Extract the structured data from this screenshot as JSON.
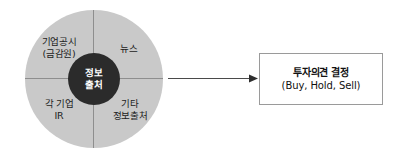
{
  "diagram": {
    "title_present": false,
    "background_color": "#ffffff",
    "source_wheel": {
      "center": {
        "line1": "정보",
        "line2": "출처",
        "fill_color": "#2b2b2b",
        "text_color": "#ffffff"
      },
      "ring_color": "#c9c9c9",
      "divider_color": "#8e8e8e",
      "quadrants": [
        {
          "position": "top-left",
          "line1": "기업공시",
          "line2": "(금감원)"
        },
        {
          "position": "top-right",
          "line1": "뉴스",
          "line2": ""
        },
        {
          "position": "bottom-left",
          "line1": "각 기업",
          "line2": "IR"
        },
        {
          "position": "bottom-right",
          "line1": "기타",
          "line2": "정보출처"
        }
      ]
    },
    "arrow": {
      "direction": "right",
      "color": "#4a4a4a"
    },
    "decision_box": {
      "line1": "투자의견 결정",
      "line2": "(Buy, Hold, Sell)",
      "border_color": "#9a9a9a",
      "fill_color": "#ffffff"
    }
  }
}
